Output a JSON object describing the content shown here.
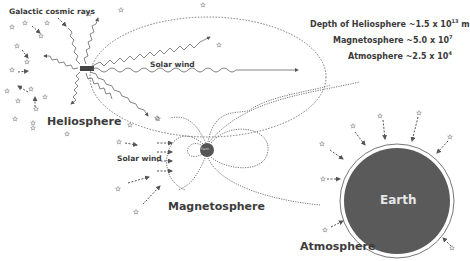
{
  "labels": {
    "galactic_cosmic_rays": "Galactic cosmic rays",
    "solar_wind_helio": "Solar wind",
    "heliosphere": "Heliosphere",
    "solar_wind_magneto": "Solar wind",
    "magnetosphere": "Magnetosphere",
    "earth_small": "Earth",
    "earth": "Earth",
    "atmosphere": "Atmosphere"
  },
  "depths": [
    {
      "name": "Depth of Heliosphere",
      "approx": "~1.5 x 10",
      "exp": "13",
      "unit": " m"
    },
    {
      "name": "Magnetosphere",
      "approx": "~5.0 x 10",
      "exp": "7",
      "unit": ""
    },
    {
      "name": "Atmosphere",
      "approx": "~2.5 x 10",
      "exp": "4",
      "unit": ""
    }
  ],
  "colors": {
    "earth_fill": "#5a5a5a",
    "line": "#555555",
    "text": "#3a3a3a"
  }
}
